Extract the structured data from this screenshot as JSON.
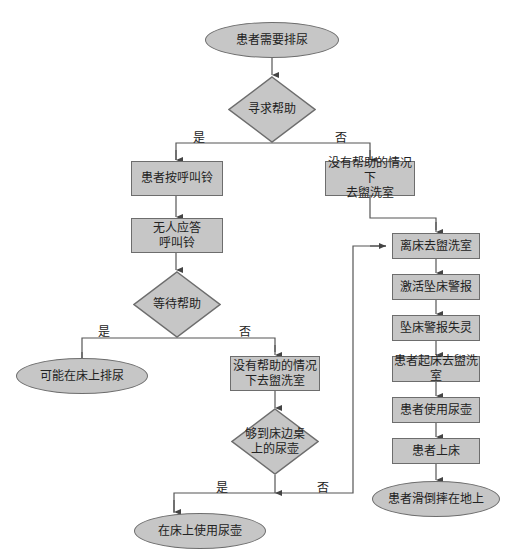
{
  "diagram": {
    "type": "flowchart",
    "colors": {
      "fill": "#c6c6c6",
      "stroke": "#6d6d6d",
      "line": "#555555",
      "text": "#222222"
    },
    "nodes": {
      "start": "患者需要排尿",
      "seek_help": "寻求帮助",
      "press_bell": "患者按呼叫铃",
      "no_answer_1": "无人应答",
      "no_answer_2": "呼叫铃",
      "wait_help": "等待帮助",
      "urinate_bed": "可能在床上排尿",
      "go_alone_right_1": "没有帮助的情况下",
      "go_alone_right_2": "去盥洗室",
      "go_alone_mid_1": "没有帮助的情况",
      "go_alone_mid_2": "下去盥洗室",
      "reach_urinal_1": "够到床边桌",
      "reach_urinal_2": "上的尿壶",
      "use_urinal_bed": "在床上使用尿壶",
      "leave_bed": "离床去盥洗室",
      "activate_alarm": "激活坠床警报",
      "alarm_fail": "坠床警报失灵",
      "get_up": "患者起床去盥洗室",
      "use_urinal": "患者使用尿壶",
      "back_bed": "患者上床",
      "fall": "患者滑倒摔在地上"
    },
    "edge_labels": {
      "yes": "是",
      "no": "否"
    }
  }
}
